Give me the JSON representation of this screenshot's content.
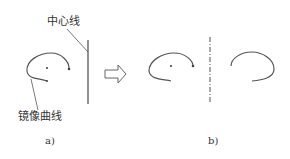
{
  "labels": {
    "centerline": "中心线",
    "mirror_curve": "镜像曲线"
  },
  "captions": {
    "a": "a)",
    "b": "b)"
  },
  "colors": {
    "stroke": "#555555",
    "text": "#333333"
  }
}
